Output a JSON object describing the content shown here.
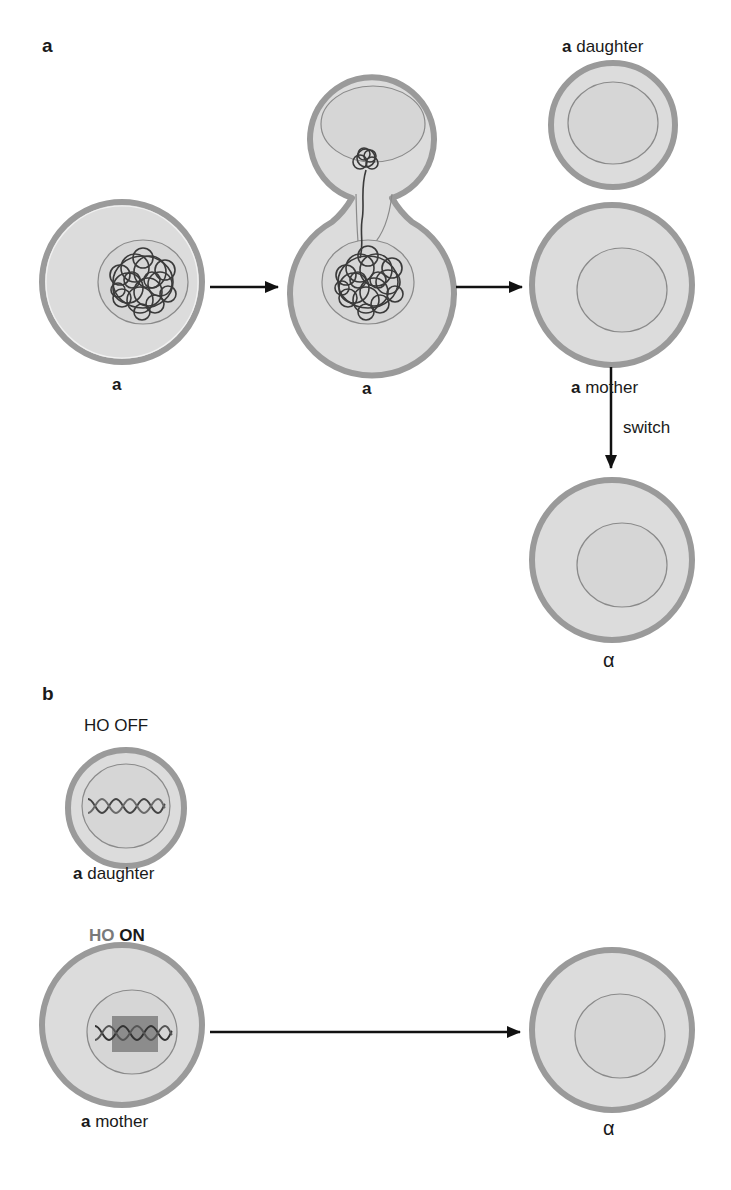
{
  "figure": {
    "panel_a": {
      "label": "a",
      "cell1_label": "a",
      "budding_cell_label": "a",
      "daughter_label_bold": "a",
      "daughter_label_text": " daughter",
      "mother_label_bold": "a",
      "mother_label_text": " mother",
      "switch_label": "switch",
      "alpha_label": "α"
    },
    "panel_b": {
      "label": "b",
      "ho_off_label": "HO OFF",
      "daughter_label_bold": "a",
      "daughter_label_text": " daughter",
      "ho_on_prefix": "HO",
      "ho_on_state": "ON",
      "mother_label_bold": "a",
      "mother_label_text": " mother",
      "alpha_label": "α"
    },
    "colors": {
      "cell_wall": "#9a9a9a",
      "cytoplasm": "#dcdcdc",
      "nucleus_outline": "#8a8a8a",
      "chromatin": "#3a3a3a",
      "ho_highlight": "#8c8c8c",
      "arrow": "#111111"
    }
  }
}
